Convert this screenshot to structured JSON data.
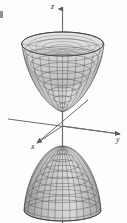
{
  "figure": {
    "surface_type": "hyperboloid-of-two-sheets",
    "render_style": "wireframe-mesh",
    "background_color": "#fdfdfd",
    "mesh_color": "#4a4a4a",
    "mesh_fill_color": "#c9c9c9",
    "axis_color": "#6b6b6b",
    "axis_labels": {
      "x": "x",
      "y": "y",
      "z": "z"
    },
    "axes": [
      {
        "name": "z-axis",
        "label": "z",
        "direction": "vertical-up",
        "arrow": true
      },
      {
        "name": "y-axis",
        "label": "y",
        "direction": "right-down",
        "arrow": true
      },
      {
        "name": "x-axis",
        "label": "x",
        "direction": "left-down",
        "arrow": true
      }
    ],
    "sheets": [
      {
        "name": "upper-sheet",
        "opening": "up",
        "position": "above-origin"
      },
      {
        "name": "lower-sheet",
        "opening": "down",
        "position": "below-origin"
      }
    ],
    "mesh_density": {
      "u_lines": 24,
      "v_lines": 12
    }
  }
}
